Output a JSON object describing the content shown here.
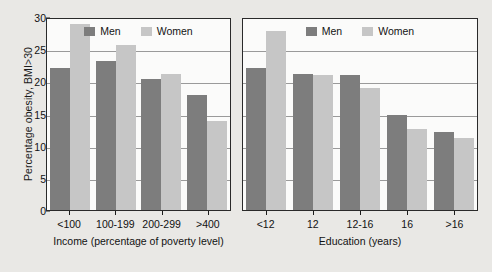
{
  "chart_data": [
    {
      "type": "bar",
      "title": "",
      "panel": "Income",
      "xlabel": "Income (percentage of poverty level)",
      "ylabel": "Percentage obesity, BMI>30",
      "categories": [
        "<100",
        "100-199",
        "200-299",
        ">400"
      ],
      "series": [
        {
          "name": "Men",
          "color": "#7d7d7d",
          "values": [
            22.0,
            23.1,
            20.4,
            17.9
          ]
        },
        {
          "name": "Women",
          "color": "#c6c6c6",
          "values": [
            28.9,
            25.6,
            21.1,
            13.9
          ]
        }
      ],
      "ylim": [
        0,
        30
      ],
      "yticks": [
        0,
        5,
        10,
        15,
        20,
        25,
        30
      ],
      "grid": true,
      "legend_position": "top-center"
    },
    {
      "type": "bar",
      "title": "",
      "panel": "Education",
      "xlabel": "Education (years)",
      "ylabel": "Percentage obesity, BMI>30",
      "categories": [
        "<12",
        "12",
        "12-16",
        "16",
        ">16"
      ],
      "series": [
        {
          "name": "Men",
          "color": "#7d7d7d",
          "values": [
            22.0,
            21.1,
            21.0,
            14.8,
            12.1
          ]
        },
        {
          "name": "Women",
          "color": "#c6c6c6",
          "values": [
            27.8,
            21.0,
            19.0,
            12.6,
            11.2
          ]
        }
      ],
      "ylim": [
        0,
        30
      ],
      "yticks": [
        0,
        5,
        10,
        15,
        20,
        25,
        30
      ],
      "grid": true,
      "legend_position": "top-center"
    }
  ],
  "axis": {
    "ylabel": "Percentage obesity, BMI>30",
    "yticks": [
      "0",
      "5",
      "10",
      "15",
      "20",
      "25",
      "30"
    ]
  },
  "legend": {
    "men": "Men",
    "women": "Women"
  },
  "colors": {
    "men": "#7d7d7d",
    "women": "#c6c6c6",
    "background": "#e9e8e5",
    "plot_background": "#fbfbfa",
    "axis": "#2a2a2a",
    "grid": "#9a9a9a"
  }
}
